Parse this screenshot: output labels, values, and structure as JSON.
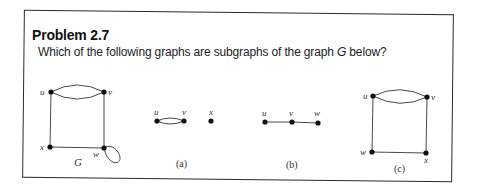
{
  "problem": {
    "title": "Problem 2.7",
    "question_pre": "Which of the following graphs are subgraphs of the graph ",
    "question_var": "G",
    "question_post": " below?"
  },
  "graphs": {
    "G": {
      "name": "G",
      "vertices": [
        "u",
        "v",
        "w",
        "x"
      ],
      "edges": [
        [
          "u",
          "v"
        ],
        [
          "u",
          "v"
        ],
        [
          "u",
          "x"
        ],
        [
          "v",
          "w"
        ],
        [
          "x",
          "w"
        ],
        [
          "w",
          "w"
        ]
      ],
      "labels": {
        "u": "u",
        "v": "v",
        "w": "w",
        "x": "x"
      }
    },
    "a": {
      "caption": "(a)",
      "vertices": [
        "u",
        "v",
        "x"
      ],
      "edges": [
        [
          "u",
          "v"
        ],
        [
          "u",
          "v"
        ]
      ],
      "labels": {
        "u": "u",
        "v": "v",
        "x": "x"
      }
    },
    "b": {
      "caption": "(b)",
      "vertices": [
        "u",
        "v",
        "w"
      ],
      "edges": [
        [
          "u",
          "v"
        ],
        [
          "v",
          "w"
        ]
      ],
      "labels": {
        "u": "u",
        "v": "v",
        "w": "w"
      }
    },
    "c": {
      "caption": "(c)",
      "vertices": [
        "u",
        "v",
        "w",
        "x"
      ],
      "edges": [
        [
          "u",
          "v"
        ],
        [
          "u",
          "v"
        ],
        [
          "u",
          "w"
        ],
        [
          "v",
          "x"
        ],
        [
          "w",
          "x"
        ]
      ],
      "labels": {
        "u": "u",
        "v": "v",
        "w": "w",
        "x": "x"
      }
    }
  }
}
